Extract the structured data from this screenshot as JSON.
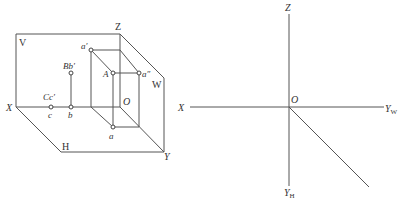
{
  "figure": {
    "left_diagram": {
      "description": "Three-projection-plane system (V, H, W) in axonometric view with points A, B, C",
      "plane_labels": {
        "v": "V",
        "h": "H",
        "w": "W"
      },
      "axis_labels": {
        "x": "X",
        "z": "Z",
        "y": "Y",
        "o": "O"
      },
      "point_labels": {
        "a_prime": "a′",
        "A": "A",
        "a_double_prime": "a″",
        "a": "a",
        "Bb_prime": "Bb′",
        "b": "b",
        "Cc_prime": "Cc′",
        "c": "c"
      }
    },
    "right_diagram": {
      "description": "Unfolded projection axes",
      "axis_labels": {
        "z": "Z",
        "x": "X",
        "o": "O",
        "yw": "Y",
        "yw_sub": "W",
        "yh": "Y",
        "yh_sub": "H"
      }
    },
    "colors": {
      "line": "#555555",
      "text": "#333333",
      "background": "#ffffff"
    }
  }
}
